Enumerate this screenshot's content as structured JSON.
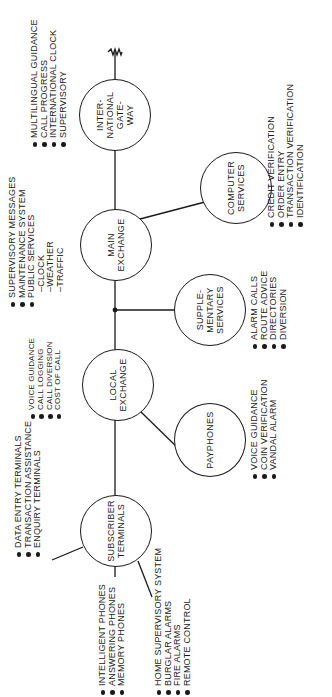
{
  "diagram": {
    "orientation": "rotated-90-ccw",
    "nodes": {
      "subscriber_terminals": {
        "label": "SUBSCRIBER\nTERMINALS"
      },
      "local_exchange": {
        "label": "LOCAL\nEXCHANGE"
      },
      "payphones": {
        "label": "PAYPHONES"
      },
      "supplementary_services": {
        "label": "SUPPLE-\nMENTARY\nSERVICES"
      },
      "main_exchange": {
        "label": "MAIN\nEXCHANGE"
      },
      "computer_services": {
        "label": "COMPUTER\nSERVICES"
      },
      "international_gateway": {
        "label": "INTER-\nNATIONAL\nGATE-\nWAY"
      }
    },
    "lists": {
      "terminals": [
        "DATA ENTRY TERMINALS",
        "TRANSACTION ASSISTANCE",
        "ENQUIRY TERMINALS"
      ],
      "phones": [
        "INTELLIGENT PHONES",
        "ANSWERING PHONES",
        "MEMORY PHONES"
      ],
      "home": [
        "HOME SUPERVISORY SYSTEM",
        "BURGLAR ALARMS",
        "FIRE ALARMS",
        "REMOTE CONTROL"
      ],
      "local_exchange": [
        "VOICE GUIDANCE",
        "CALL LOGGING",
        "CALL DIVERSION",
        "COST OF CALL"
      ],
      "payphones": [
        "VOICE GUIDANCE",
        "COIN VERIFICATION",
        "VANDAL ALARM"
      ],
      "supplementary": [
        "ALARM CALLS",
        "ROUTE ADVICE",
        "DIRECTORIES",
        "DIVERSION"
      ],
      "main_exchange": [
        "SUPERVISORY MESSAGES",
        "MAINTENANCE SYSTEM",
        "PUBLIC SERVICES"
      ],
      "main_exchange_sub": [
        "–CLOCK",
        "–WEATHER",
        "–TRAFFIC"
      ],
      "computer": [
        "CREDIT VERIFICATION",
        "ORDER ENTRY",
        "TRANSACTION VERIFICATION",
        "IDENTIFICATION"
      ],
      "gateway": [
        "MULTILINGUAL GUIDANCE",
        "CALL PROGRESS",
        "INTERNATIONAL CLOCK",
        "SUPERVISORY"
      ]
    }
  }
}
